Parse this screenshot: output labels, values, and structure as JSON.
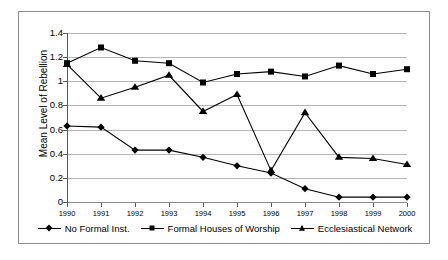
{
  "chart_data": {
    "type": "line",
    "title": "",
    "xlabel": "",
    "ylabel": "Mean Level of Rebellion",
    "ylim": [
      0,
      1.4
    ],
    "grid": true,
    "legend_position": "bottom",
    "categories": [
      "1990",
      "1991",
      "1992",
      "1993",
      "1994",
      "1995",
      "1996",
      "1997",
      "1998",
      "1999",
      "2000"
    ],
    "x": [
      1990,
      1991,
      1992,
      1993,
      1994,
      1995,
      1996,
      1997,
      1998,
      1999,
      2000
    ],
    "ytick_labels": [
      "0",
      "0.2",
      "0.4",
      "0.6",
      "0.8",
      "1",
      "1.2",
      "1.4"
    ],
    "ytick_values": [
      0,
      0.2,
      0.4,
      0.6,
      0.8,
      1.0,
      1.2,
      1.4
    ],
    "series": [
      {
        "name": "No Formal Inst.",
        "marker": "diamond",
        "color": "#000000",
        "values": [
          0.63,
          0.62,
          0.43,
          0.43,
          0.37,
          0.3,
          0.24,
          0.11,
          0.04,
          0.04,
          0.04
        ]
      },
      {
        "name": "Formal Houses of Worship",
        "marker": "square",
        "color": "#000000",
        "values": [
          1.15,
          1.28,
          1.17,
          1.15,
          0.99,
          1.06,
          1.08,
          1.04,
          1.13,
          1.06,
          1.1
        ]
      },
      {
        "name": "Ecclesiastical Network",
        "marker": "triangle",
        "color": "#000000",
        "values": [
          1.14,
          0.86,
          0.95,
          1.05,
          0.75,
          0.89,
          0.26,
          0.74,
          0.37,
          0.36,
          0.31
        ]
      }
    ]
  }
}
